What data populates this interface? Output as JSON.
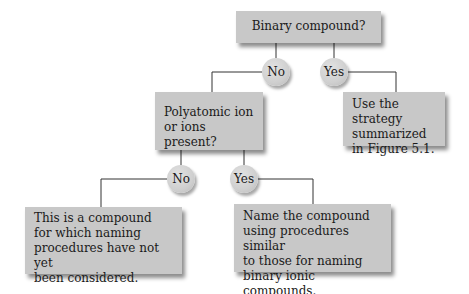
{
  "diagram": {
    "type": "decision-flowchart",
    "nodes": {
      "root": {
        "label": "Binary compound?"
      },
      "no1": {
        "label": "No"
      },
      "yes1": {
        "label": "Yes"
      },
      "polyatomic": {
        "label": "Polyatomic ion\nor ions present?"
      },
      "strategy": {
        "label": "Use the strategy\nsummarized\nin Figure 5.1."
      },
      "no2": {
        "label": "No"
      },
      "yes2": {
        "label": "Yes"
      },
      "not_considered": {
        "label": "This is a compound\nfor which naming\nprocedures have not yet\nbeen considered."
      },
      "name_compound": {
        "label": "Name the compound\nusing procedures similar\nto those for naming\nbinary ionic compounds."
      }
    },
    "edges": [
      {
        "from": "root",
        "to": "no1"
      },
      {
        "from": "root",
        "to": "yes1"
      },
      {
        "from": "no1",
        "to": "polyatomic"
      },
      {
        "from": "yes1",
        "to": "strategy"
      },
      {
        "from": "polyatomic",
        "to": "no2"
      },
      {
        "from": "polyatomic",
        "to": "yes2"
      },
      {
        "from": "no2",
        "to": "not_considered"
      },
      {
        "from": "yes2",
        "to": "name_compound"
      }
    ],
    "colors": {
      "box_fill": "#c8c8c8",
      "line": "#333333",
      "text": "#1a1a1a"
    }
  }
}
